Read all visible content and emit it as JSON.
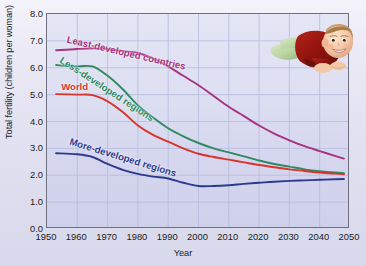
{
  "axes": {
    "xlabel": "Year",
    "ylabel": "Total fertility (children per woman)",
    "yticks": [
      "0.0",
      "1.0",
      "2.0",
      "3.0",
      "4.0",
      "5.0",
      "6.0",
      "7.0",
      "8.0"
    ],
    "xticks": [
      "1950",
      "1960",
      "1970",
      "1980",
      "1990",
      "2000",
      "2010",
      "2020",
      "2030",
      "2040",
      "2050"
    ]
  },
  "annotations": {
    "least": "Least-developed countries",
    "less": "Less-developed regions",
    "world": "World",
    "more": "More-developed regions"
  },
  "colors": {
    "least": "#a8327e",
    "less": "#2e8a5e",
    "world": "#d9342b",
    "more": "#2b3a8f",
    "plot_bg": "#dcdef2",
    "grid": "#b9bedf",
    "figure_bg": "#e6e5f2"
  },
  "photo": {
    "name": "baby-photograph",
    "alt": "Smiling baby lying on stomach"
  },
  "chart_data": {
    "type": "line",
    "title": "",
    "xlabel": "Year",
    "ylabel": "Total fertility (children per woman)",
    "xlim": [
      1950,
      2050
    ],
    "ylim": [
      0.0,
      8.0
    ],
    "ytick_step": 1.0,
    "xtick_step": 10,
    "grid": true,
    "legend": "inline-annotations",
    "x": [
      1953,
      1960,
      1965,
      1970,
      1975,
      1980,
      1985,
      1990,
      1995,
      2000,
      2005,
      2010,
      2015,
      2020,
      2025,
      2030,
      2035,
      2040,
      2045,
      2048
    ],
    "series": [
      {
        "name": "Least-developed countries",
        "color": "#a8327e",
        "values": [
          6.65,
          6.7,
          6.72,
          6.7,
          6.62,
          6.55,
          6.35,
          6.05,
          5.7,
          5.35,
          4.95,
          4.55,
          4.2,
          3.85,
          3.55,
          3.3,
          3.08,
          2.9,
          2.72,
          2.62
        ]
      },
      {
        "name": "Less-developed regions",
        "color": "#2e8a5e",
        "values": [
          6.1,
          6.05,
          6.05,
          5.7,
          5.2,
          4.6,
          4.15,
          3.75,
          3.45,
          3.2,
          3.0,
          2.85,
          2.7,
          2.55,
          2.42,
          2.32,
          2.22,
          2.15,
          2.1,
          2.08
        ]
      },
      {
        "name": "World",
        "color": "#d9342b",
        "values": [
          5.02,
          5.0,
          4.98,
          4.75,
          4.35,
          3.85,
          3.5,
          3.25,
          3.0,
          2.8,
          2.68,
          2.58,
          2.48,
          2.38,
          2.3,
          2.22,
          2.16,
          2.1,
          2.06,
          2.04
        ]
      },
      {
        "name": "More-developed regions",
        "color": "#2b3a8f",
        "values": [
          2.82,
          2.78,
          2.68,
          2.42,
          2.2,
          2.05,
          1.95,
          1.88,
          1.72,
          1.6,
          1.6,
          1.63,
          1.68,
          1.72,
          1.76,
          1.79,
          1.81,
          1.83,
          1.85,
          1.86
        ]
      }
    ]
  }
}
